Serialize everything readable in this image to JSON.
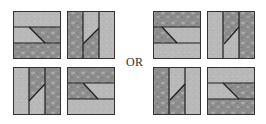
{
  "diagram": {
    "separator_label": "OR",
    "colors": {
      "light_fill": "#b9b9b9",
      "textured_fill": "#8c8c8c",
      "texture_blob": "#a9a9a9",
      "line": "#1e1e1e",
      "background": "#ffffff"
    },
    "groups": [
      {
        "name": "left-group",
        "tiles": [
          {
            "id": 1,
            "orientation": "horizontal",
            "x": 13,
            "y": 11,
            "strips": [
              "light",
              "split",
              "textured"
            ],
            "diagonal": [
              [
                29,
                27
              ],
              [
                45,
                43
              ]
            ],
            "split_left": "light",
            "split_right": "textured"
          },
          {
            "id": 2,
            "orientation": "vertical",
            "x": 67,
            "y": 11,
            "strips": [
              "textured",
              "split",
              "light"
            ],
            "diagonal": [
              [
                99,
                28
              ],
              [
                83,
                44
              ]
            ],
            "split_top": "light",
            "split_bottom": "textured"
          },
          {
            "id": 3,
            "orientation": "vertical",
            "x": 13,
            "y": 67,
            "strips": [
              "light",
              "split",
              "textured"
            ],
            "diagonal": [
              [
                45,
                84
              ],
              [
                29,
                101
              ]
            ],
            "split_top": "textured",
            "split_bottom": "light"
          },
          {
            "id": 4,
            "orientation": "horizontal",
            "x": 67,
            "y": 67,
            "strips": [
              "textured",
              "split",
              "light"
            ],
            "diagonal": [
              [
                83,
                83
              ],
              [
                98,
                99
              ]
            ],
            "split_left": "textured",
            "split_right": "light"
          }
        ]
      },
      {
        "name": "right-group",
        "tiles": [
          {
            "id": 5,
            "orientation": "horizontal",
            "x": 153,
            "y": 11,
            "strips": [
              "textured",
              "split",
              "light"
            ],
            "diagonal": [
              [
                162,
                27
              ],
              [
                177,
                43
              ]
            ],
            "split_left": "textured",
            "split_right": "light"
          },
          {
            "id": 6,
            "orientation": "vertical",
            "x": 207,
            "y": 11,
            "strips": [
              "light",
              "split",
              "textured"
            ],
            "diagonal": [
              [
                239,
                27
              ],
              [
                224,
                44
              ]
            ],
            "split_top": "textured",
            "split_bottom": "light"
          },
          {
            "id": 7,
            "orientation": "vertical",
            "x": 153,
            "y": 67,
            "strips": [
              "textured",
              "split",
              "light"
            ],
            "diagonal": [
              [
                185,
                84
              ],
              [
                170,
                100
              ]
            ],
            "split_top": "light",
            "split_bottom": "textured"
          },
          {
            "id": 8,
            "orientation": "horizontal",
            "x": 207,
            "y": 67,
            "strips": [
              "light",
              "split",
              "textured"
            ],
            "diagonal": [
              [
                223,
                83
              ],
              [
                239,
                99
              ]
            ],
            "split_left": "light",
            "split_right": "textured"
          }
        ]
      }
    ]
  }
}
